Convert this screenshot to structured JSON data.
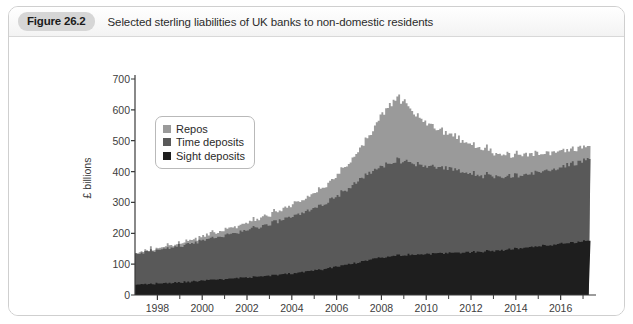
{
  "figure": {
    "number_label": "Figure 26.2",
    "title": "Selected sterling liabilities of UK banks to non-domestic residents"
  },
  "chart_data": {
    "type": "area",
    "stacked": true,
    "title": "Selected sterling liabilities of UK banks to non-domestic residents",
    "xlabel": "",
    "ylabel": "£ billions",
    "ylim": [
      0,
      700
    ],
    "xlim": [
      1997.0,
      2017.4
    ],
    "ytick_labels": [
      "0",
      "100",
      "200",
      "300",
      "400",
      "500",
      "600",
      "700"
    ],
    "yticks": [
      0,
      100,
      200,
      300,
      400,
      500,
      600,
      700
    ],
    "xticks": [
      1998,
      2000,
      2002,
      2004,
      2006,
      2008,
      2010,
      2012,
      2014,
      2016
    ],
    "xtick_labels": [
      "1998",
      "2000",
      "2002",
      "2004",
      "2006",
      "2008",
      "2010",
      "2012",
      "2014",
      "2016"
    ],
    "xminor_ticks": [
      1999,
      2001,
      2003,
      2005,
      2007,
      2009,
      2011,
      2013,
      2015,
      2017
    ],
    "grid": false,
    "legend_position": "upper-left-inside",
    "colors": {
      "repos": "#9a9a9a",
      "time_deposits": "#595959",
      "sight_deposits": "#1e1e1e"
    },
    "series": [
      {
        "name": "Sight deposits",
        "color": "#1e1e1e",
        "stack_order": 1,
        "x": [
          1997.0,
          1997.25,
          1997.5,
          1997.75,
          1998.0,
          1998.25,
          1998.5,
          1998.75,
          1999.0,
          1999.25,
          1999.5,
          1999.75,
          2000.0,
          2000.25,
          2000.5,
          2000.75,
          2001.0,
          2001.25,
          2001.5,
          2001.75,
          2002.0,
          2002.25,
          2002.5,
          2002.75,
          2003.0,
          2003.25,
          2003.5,
          2003.75,
          2004.0,
          2004.25,
          2004.5,
          2004.75,
          2005.0,
          2005.25,
          2005.5,
          2005.75,
          2006.0,
          2006.25,
          2006.5,
          2006.75,
          2007.0,
          2007.25,
          2007.5,
          2007.75,
          2008.0,
          2008.25,
          2008.5,
          2008.75,
          2009.0,
          2009.25,
          2009.5,
          2009.75,
          2010.0,
          2010.25,
          2010.5,
          2010.75,
          2011.0,
          2011.25,
          2011.5,
          2011.75,
          2012.0,
          2012.25,
          2012.5,
          2012.75,
          2013.0,
          2013.25,
          2013.5,
          2013.75,
          2014.0,
          2014.25,
          2014.5,
          2014.75,
          2015.0,
          2015.25,
          2015.5,
          2015.75,
          2016.0,
          2016.25,
          2016.5,
          2016.75,
          2017.0,
          2017.25
        ],
        "values": [
          33,
          34,
          35,
          36,
          37,
          38,
          39,
          40,
          41,
          42,
          43,
          44,
          46,
          47,
          48,
          50,
          51,
          52,
          54,
          55,
          57,
          58,
          60,
          61,
          63,
          64,
          66,
          68,
          70,
          72,
          74,
          76,
          79,
          82,
          85,
          88,
          92,
          95,
          99,
          103,
          107,
          111,
          115,
          119,
          122,
          125,
          127,
          129,
          130,
          130,
          131,
          132,
          133,
          133,
          134,
          135,
          136,
          136,
          137,
          138,
          139,
          140,
          141,
          142,
          143,
          145,
          146,
          148,
          150,
          152,
          154,
          156,
          158,
          160,
          162,
          164,
          166,
          168,
          170,
          172,
          174,
          176
        ]
      },
      {
        "name": "Time deposits",
        "color": "#595959",
        "stack_order": 2,
        "x": [
          1997.0,
          1997.25,
          1997.5,
          1997.75,
          1998.0,
          1998.25,
          1998.5,
          1998.75,
          1999.0,
          1999.25,
          1999.5,
          1999.75,
          2000.0,
          2000.25,
          2000.5,
          2000.75,
          2001.0,
          2001.25,
          2001.5,
          2001.75,
          2002.0,
          2002.25,
          2002.5,
          2002.75,
          2003.0,
          2003.25,
          2003.5,
          2003.75,
          2004.0,
          2004.25,
          2004.5,
          2004.75,
          2005.0,
          2005.25,
          2005.5,
          2005.75,
          2006.0,
          2006.25,
          2006.5,
          2006.75,
          2007.0,
          2007.25,
          2007.5,
          2007.75,
          2008.0,
          2008.25,
          2008.5,
          2008.75,
          2009.0,
          2009.25,
          2009.5,
          2009.75,
          2010.0,
          2010.25,
          2010.5,
          2010.75,
          2011.0,
          2011.25,
          2011.5,
          2011.75,
          2012.0,
          2012.25,
          2012.5,
          2012.75,
          2013.0,
          2013.25,
          2013.5,
          2013.75,
          2014.0,
          2014.25,
          2014.5,
          2014.75,
          2015.0,
          2015.25,
          2015.5,
          2015.75,
          2016.0,
          2016.25,
          2016.5,
          2016.75,
          2017.0,
          2017.25
        ],
        "values": [
          97,
          100,
          103,
          106,
          109,
          112,
          114,
          116,
          119,
          121,
          124,
          127,
          130,
          133,
          136,
          139,
          142,
          145,
          148,
          151,
          154,
          157,
          160,
          163,
          167,
          171,
          175,
          179,
          183,
          187,
          192,
          197,
          202,
          208,
          215,
          222,
          230,
          238,
          247,
          256,
          266,
          275,
          283,
          291,
          298,
          303,
          306,
          307,
          304,
          298,
          292,
          288,
          284,
          281,
          278,
          274,
          270,
          266,
          262,
          258,
          254,
          250,
          247,
          244,
          241,
          239,
          237,
          236,
          235,
          235,
          236,
          238,
          240,
          242,
          244,
          247,
          250,
          253,
          256,
          259,
          262,
          265
        ]
      },
      {
        "name": "Repos",
        "color": "#9a9a9a",
        "stack_order": 3,
        "x": [
          1997.0,
          1997.25,
          1997.5,
          1997.75,
          1998.0,
          1998.25,
          1998.5,
          1998.75,
          1999.0,
          1999.25,
          1999.5,
          1999.75,
          2000.0,
          2000.25,
          2000.5,
          2000.75,
          2001.0,
          2001.25,
          2001.5,
          2001.75,
          2002.0,
          2002.25,
          2002.5,
          2002.75,
          2003.0,
          2003.25,
          2003.5,
          2003.75,
          2004.0,
          2004.25,
          2004.5,
          2004.75,
          2005.0,
          2005.25,
          2005.5,
          2005.75,
          2006.0,
          2006.25,
          2006.5,
          2006.75,
          2007.0,
          2007.25,
          2007.5,
          2007.75,
          2008.0,
          2008.25,
          2008.5,
          2008.75,
          2009.0,
          2009.25,
          2009.5,
          2009.75,
          2010.0,
          2010.25,
          2010.5,
          2010.75,
          2011.0,
          2011.25,
          2011.5,
          2011.75,
          2012.0,
          2012.25,
          2012.5,
          2012.75,
          2013.0,
          2013.25,
          2013.5,
          2013.75,
          2014.0,
          2014.25,
          2014.5,
          2014.75,
          2015.0,
          2015.25,
          2015.5,
          2015.75,
          2016.0,
          2016.25,
          2016.5,
          2016.75,
          2017.0,
          2017.25
        ],
        "values": [
          2,
          3,
          4,
          5,
          6,
          7,
          8,
          9,
          10,
          11,
          12,
          13,
          14,
          15,
          16,
          17,
          18,
          19,
          20,
          21,
          22,
          24,
          26,
          28,
          30,
          32,
          34,
          36,
          38,
          40,
          43,
          46,
          50,
          54,
          58,
          63,
          68,
          74,
          80,
          88,
          96,
          110,
          128,
          148,
          168,
          185,
          196,
          200,
          192,
          175,
          158,
          145,
          135,
          128,
          122,
          117,
          112,
          107,
          102,
          98,
          94,
          90,
          86,
          82,
          78,
          75,
          72,
          70,
          68,
          66,
          64,
          62,
          60,
          58,
          56,
          54,
          52,
          50,
          48,
          46,
          44,
          42
        ]
      }
    ],
    "annotations": {
      "peak_value": 640,
      "peak_period": "2008",
      "end_value": 460
    }
  },
  "legend": {
    "items": [
      {
        "label": "Repos",
        "color": "#9a9a9a"
      },
      {
        "label": "Time deposits",
        "color": "#595959"
      },
      {
        "label": "Sight deposits",
        "color": "#1e1e1e"
      }
    ]
  }
}
